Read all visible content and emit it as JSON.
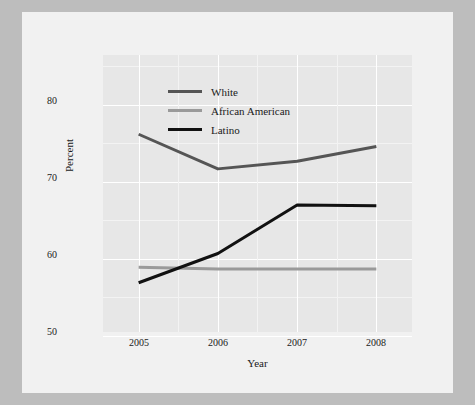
{
  "chart_data": {
    "type": "line",
    "title": "",
    "xlabel": "Year",
    "ylabel": "Percent",
    "categories": [
      "2005",
      "2006",
      "2007",
      "2008"
    ],
    "x": [
      2005,
      2006,
      2007,
      2008
    ],
    "xlim": [
      2004.55,
      2008.45
    ],
    "ylim": [
      47.5,
      83.5
    ],
    "yticks": [
      50,
      60,
      70,
      80
    ],
    "ytick_labels": [
      "50",
      "60",
      "70",
      "80"
    ],
    "xticks": [
      2005,
      2006,
      2007,
      2008
    ],
    "xtick_labels": [
      "2005",
      "2006",
      "2007",
      "2008"
    ],
    "grid": true,
    "grid_color": "#ffffff",
    "panel_background": "#e7e7e7",
    "legend_position": "top-left-inside",
    "series": [
      {
        "name": "White",
        "color": "#555555",
        "values": [
          73.2,
          68.7,
          69.7,
          71.6
        ]
      },
      {
        "name": "African American",
        "color": "#9a9a9a",
        "values": [
          55.9,
          55.7,
          55.7,
          55.7
        ]
      },
      {
        "name": "Latino",
        "color": "#111111",
        "values": [
          53.9,
          57.7,
          64.0,
          63.9
        ]
      }
    ]
  },
  "legend": {
    "items": [
      {
        "label": "White",
        "color": "#555555"
      },
      {
        "label": "African American",
        "color": "#9a9a9a"
      },
      {
        "label": "Latino",
        "color": "#111111"
      }
    ]
  },
  "axes": {
    "y_title": "Percent",
    "x_title": "Year",
    "y_tick_labels": [
      "80",
      "70",
      "60",
      "50"
    ],
    "x_tick_labels": [
      "2005",
      "2006",
      "2007",
      "2008"
    ]
  }
}
